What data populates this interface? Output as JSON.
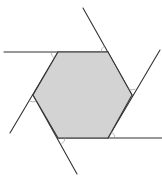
{
  "diagram": {
    "title": "",
    "width": 162,
    "height": 176,
    "colors": {
      "hexagon_fill": "#d3d3d3",
      "line": "#333333",
      "arc": "#999999",
      "background": "#ffffff"
    },
    "hexagon": {
      "vertices": [
        [
          58,
          52
        ],
        [
          108,
          52
        ],
        [
          132,
          95
        ],
        [
          108,
          138
        ],
        [
          58,
          138
        ],
        [
          33,
          95
        ]
      ]
    },
    "extension_lines": [
      {
        "name": "top-edge-extension",
        "from": [
          108,
          52
        ],
        "to": [
          4,
          52
        ]
      },
      {
        "name": "top-right-edge-extension",
        "from": [
          132,
          95
        ],
        "to": [
          83,
          8
        ]
      },
      {
        "name": "right-edge-extension",
        "from": [
          108,
          138
        ],
        "to": [
          160,
          50
        ]
      },
      {
        "name": "bottom-edge-extension",
        "from": [
          58,
          138
        ],
        "to": [
          162,
          138
        ]
      },
      {
        "name": "bottom-left-edge-extension",
        "from": [
          33,
          95
        ],
        "to": [
          77,
          174
        ]
      },
      {
        "name": "left-edge-extension",
        "from": [
          58,
          52
        ],
        "to": [
          10,
          133
        ]
      }
    ],
    "angle_arcs": [
      {
        "name": "arc-top-left",
        "d": "M 51 52 A 7 7 0 0 0 54.4 58"
      },
      {
        "name": "arc-top-right",
        "d": "M 104.6 46 A 7 7 0 0 0 101 52"
      },
      {
        "name": "arc-right",
        "d": "M 128.6 89 A 7 7 0 0 0 135.4 89"
      },
      {
        "name": "arc-bottom-right",
        "d": "M 115 138 A 7 7 0 0 0 111.4 132"
      },
      {
        "name": "arc-bottom-left",
        "d": "M 61.4 144 A 7 7 0 0 0 65 138"
      },
      {
        "name": "arc-left",
        "d": "M 36.4 101 A 7 7 0 0 1 29.6 101"
      }
    ]
  }
}
